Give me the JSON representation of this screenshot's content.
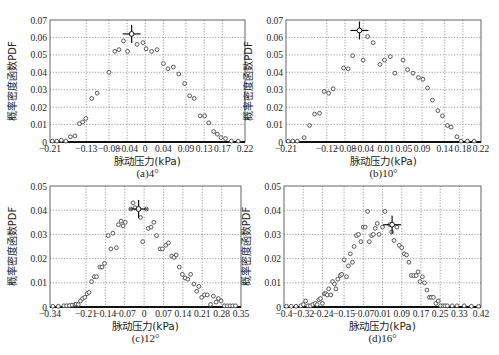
{
  "chart_data": [
    {
      "id": "a",
      "type": "scatter",
      "caption": "(a)4°",
      "xlabel": "脉动压力(kPa)",
      "ylabel": "概率密度函数PDF",
      "frame": [
        50,
        20,
        245,
        142
      ],
      "xlim": [
        -0.21,
        0.22
      ],
      "ylim": [
        0,
        0.07
      ],
      "xticks": [
        -0.21,
        -0.13,
        -0.08,
        -0.04,
        0,
        0.04,
        0.09,
        0.13,
        0.17,
        0.22
      ],
      "xtick_labels": [
        "−0.21",
        "−0.13",
        "−0.08",
        "−0.04",
        "0",
        "0.04",
        "0.09",
        "0.13",
        "0.17",
        "0.22"
      ],
      "yticks": [
        0,
        0.01,
        0.02,
        0.03,
        0.04,
        0.05,
        0.06,
        0.07
      ],
      "ytick_labels": [
        "0",
        "0.01",
        "0.02",
        "0.03",
        "0.04",
        "0.05",
        "0.06",
        "0.07"
      ],
      "grid": true,
      "marker_point": [
        -0.03,
        0.062
      ],
      "points": [
        [
          -0.205,
          0.0005
        ],
        [
          -0.195,
          0.0005
        ],
        [
          -0.185,
          0.001
        ],
        [
          -0.175,
          0.0005
        ],
        [
          -0.165,
          0.003
        ],
        [
          -0.155,
          0.0035
        ],
        [
          -0.145,
          0.0105
        ],
        [
          -0.138,
          0.0115
        ],
        [
          -0.131,
          0.0135
        ],
        [
          -0.118,
          0.025
        ],
        [
          -0.106,
          0.028
        ],
        [
          -0.08,
          0.04
        ],
        [
          -0.067,
          0.052
        ],
        [
          -0.058,
          0.053
        ],
        [
          -0.048,
          0.058
        ],
        [
          -0.039,
          0.052
        ],
        [
          -0.03,
          0.062
        ],
        [
          -0.018,
          0.056
        ],
        [
          -0.005,
          0.057
        ],
        [
          0.002,
          0.0535
        ],
        [
          0.014,
          0.052
        ],
        [
          0.026,
          0.053
        ],
        [
          0.04,
          0.045
        ],
        [
          0.05,
          0.042
        ],
        [
          0.062,
          0.043
        ],
        [
          0.074,
          0.039
        ],
        [
          0.087,
          0.0335
        ],
        [
          0.098,
          0.0265
        ],
        [
          0.108,
          0.025
        ],
        [
          0.121,
          0.015
        ],
        [
          0.131,
          0.015
        ],
        [
          0.14,
          0.011
        ],
        [
          0.151,
          0.006
        ],
        [
          0.159,
          0.0045
        ],
        [
          0.167,
          0.0025
        ],
        [
          0.177,
          0.002
        ],
        [
          0.19,
          0.0005
        ],
        [
          0.205,
          0.0005
        ]
      ]
    },
    {
      "id": "b",
      "type": "scatter",
      "caption": "(b)10°",
      "xlabel": "脉动压力(kPa)",
      "ylabel": "概率密度函数PDF",
      "frame": [
        286,
        20,
        481,
        142
      ],
      "xlim": [
        -0.21,
        0.22
      ],
      "ylim": [
        0,
        0.07
      ],
      "xticks": [
        -0.21,
        -0.12,
        -0.08,
        -0.04,
        0.01,
        0.05,
        0.09,
        0.14,
        0.18,
        0.22
      ],
      "xtick_labels": [
        "−0.21",
        "−0.12",
        "−0.08",
        "−0.04",
        "0.01",
        "0.05",
        "0.09",
        "0.14",
        "0.18",
        "0.22"
      ],
      "yticks": [
        0,
        0.01,
        0.02,
        0.03,
        0.04,
        0.05,
        0.06,
        0.07
      ],
      "ytick_labels": [
        "0",
        "0.01",
        "0.02",
        "0.03",
        "0.04",
        "0.05",
        "0.06",
        "0.07"
      ],
      "grid": true,
      "marker_point": [
        -0.048,
        0.064
      ],
      "points": [
        [
          -0.205,
          0.0005
        ],
        [
          -0.195,
          0.0005
        ],
        [
          -0.185,
          0.0005
        ],
        [
          -0.17,
          0.0025
        ],
        [
          -0.158,
          0.0095
        ],
        [
          -0.147,
          0.016
        ],
        [
          -0.136,
          0.0165
        ],
        [
          -0.126,
          0.029
        ],
        [
          -0.116,
          0.028
        ],
        [
          -0.106,
          0.0305
        ],
        [
          -0.083,
          0.0425
        ],
        [
          -0.073,
          0.042
        ],
        [
          -0.063,
          0.0495
        ],
        [
          -0.04,
          0.047
        ],
        [
          -0.03,
          0.0605
        ],
        [
          -0.018,
          0.057
        ],
        [
          -0.003,
          0.0445
        ],
        [
          0.007,
          0.047
        ],
        [
          0.02,
          0.049
        ],
        [
          0.03,
          0.0395
        ],
        [
          0.048,
          0.047
        ],
        [
          0.058,
          0.0415
        ],
        [
          0.07,
          0.0395
        ],
        [
          0.082,
          0.037
        ],
        [
          0.092,
          0.036
        ],
        [
          0.102,
          0.031
        ],
        [
          0.113,
          0.024
        ],
        [
          0.125,
          0.018
        ],
        [
          0.135,
          0.015
        ],
        [
          0.146,
          0.0095
        ],
        [
          0.154,
          0.0085
        ],
        [
          0.167,
          0.003
        ],
        [
          0.176,
          0.0005
        ],
        [
          0.19,
          0.0005
        ],
        [
          0.205,
          0.0005
        ]
      ]
    },
    {
      "id": "c",
      "type": "scatter",
      "caption": "(c)12°",
      "xlabel": "脉动压力(kPa)",
      "ylabel": "概率密度函数PDF",
      "frame": [
        50,
        186,
        241,
        307
      ],
      "xlim": [
        -0.34,
        0.35
      ],
      "ylim": [
        0,
        0.05
      ],
      "xticks": [
        -0.34,
        -0.21,
        -0.14,
        -0.07,
        0,
        0.07,
        0.14,
        0.21,
        0.28,
        0.35
      ],
      "xtick_labels": [
        "−0.34",
        "−0.21",
        "−0.14",
        "−0.07",
        "0",
        "0.07",
        "0.14",
        "0.21",
        "0.28",
        "0.35"
      ],
      "yticks": [
        0,
        0.01,
        0.02,
        0.03,
        0.04,
        0.05
      ],
      "ytick_labels": [
        "0",
        "0.01",
        "0.02",
        "0.03",
        "0.04",
        "0.05"
      ],
      "grid": true,
      "marker_point": [
        -0.02,
        0.0405
      ],
      "points": [
        [
          -0.33,
          0.0003
        ],
        [
          -0.31,
          0.0003
        ],
        [
          -0.29,
          0.0005
        ],
        [
          -0.28,
          0.0005
        ],
        [
          -0.27,
          0.0006
        ],
        [
          -0.26,
          0.0008
        ],
        [
          -0.25,
          0.001
        ],
        [
          -0.245,
          0.0012
        ],
        [
          -0.238,
          0.001
        ],
        [
          -0.23,
          0.0025
        ],
        [
          -0.222,
          0.0035
        ],
        [
          -0.214,
          0.004
        ],
        [
          -0.206,
          0.0055
        ],
        [
          -0.199,
          0.006
        ],
        [
          -0.19,
          0.0105
        ],
        [
          -0.18,
          0.0125
        ],
        [
          -0.172,
          0.0125
        ],
        [
          -0.16,
          0.0165
        ],
        [
          -0.152,
          0.0165
        ],
        [
          -0.143,
          0.018
        ],
        [
          -0.13,
          0.0295
        ],
        [
          -0.12,
          0.024
        ],
        [
          -0.113,
          0.0305
        ],
        [
          -0.1,
          0.0245
        ],
        [
          -0.093,
          0.034
        ],
        [
          -0.083,
          0.0355
        ],
        [
          -0.076,
          0.0335
        ],
        [
          -0.068,
          0.035
        ],
        [
          -0.048,
          0.0405
        ],
        [
          -0.04,
          0.043
        ],
        [
          -0.033,
          0.041
        ],
        [
          -0.02,
          0.0405
        ],
        [
          -0.013,
          0.037
        ],
        [
          -0.005,
          0.027
        ],
        [
          0.008,
          0.0405
        ],
        [
          0.015,
          0.0325
        ],
        [
          0.025,
          0.033
        ],
        [
          0.035,
          0.035
        ],
        [
          0.045,
          0.0295
        ],
        [
          0.058,
          0.024
        ],
        [
          0.066,
          0.024
        ],
        [
          0.078,
          0.0255
        ],
        [
          0.088,
          0.0265
        ],
        [
          0.1,
          0.021
        ],
        [
          0.108,
          0.0205
        ],
        [
          0.116,
          0.0215
        ],
        [
          0.127,
          0.0165
        ],
        [
          0.138,
          0.0135
        ],
        [
          0.148,
          0.012
        ],
        [
          0.158,
          0.0115
        ],
        [
          0.168,
          0.0135
        ],
        [
          0.18,
          0.0095
        ],
        [
          0.19,
          0.0065
        ],
        [
          0.198,
          0.0085
        ],
        [
          0.208,
          0.004
        ],
        [
          0.218,
          0.005
        ],
        [
          0.228,
          0.005
        ],
        [
          0.24,
          0.001
        ],
        [
          0.25,
          0.0045
        ],
        [
          0.26,
          0.002
        ],
        [
          0.268,
          0.0035
        ],
        [
          0.278,
          0.0025
        ],
        [
          0.29,
          0.0005
        ],
        [
          0.3,
          0.0005
        ],
        [
          0.31,
          0.0005
        ],
        [
          0.32,
          0.0005
        ],
        [
          0.33,
          0.0005
        ]
      ]
    },
    {
      "id": "d",
      "type": "scatter",
      "caption": "(d)16°",
      "xlabel": "脉动压力(kPa)",
      "ylabel": "概率密度函数PDF",
      "frame": [
        284,
        186,
        481,
        307
      ],
      "xlim": [
        -0.4,
        0.42
      ],
      "ylim": [
        0,
        0.05
      ],
      "xticks": [
        -0.4,
        -0.32,
        -0.24,
        -0.15,
        -0.07,
        0.01,
        0.09,
        0.17,
        0.25,
        0.33,
        0.42
      ],
      "xtick_labels": [
        "−0.4",
        "−0.32",
        "−0.24",
        "−0.15",
        "−0.07",
        "0.01",
        "0.09",
        "0.17",
        "0.25",
        "0.33",
        "0.42"
      ],
      "yticks": [
        0,
        0.01,
        0.02,
        0.03,
        0.04,
        0.05
      ],
      "ytick_labels": [
        "0",
        "0.01",
        "0.02",
        "0.03",
        "0.04",
        "0.05"
      ],
      "grid": true,
      "marker_point": [
        0.05,
        0.034
      ],
      "points": [
        [
          -0.39,
          0.0003
        ],
        [
          -0.37,
          0.0003
        ],
        [
          -0.35,
          0.0003
        ],
        [
          -0.33,
          0.0005
        ],
        [
          -0.32,
          0.001
        ],
        [
          -0.31,
          0.0025
        ],
        [
          -0.3,
          0.0005
        ],
        [
          -0.29,
          0.0005
        ],
        [
          -0.28,
          0.001
        ],
        [
          -0.27,
          0.0015
        ],
        [
          -0.262,
          0.001
        ],
        [
          -0.255,
          0.003
        ],
        [
          -0.248,
          0.0035
        ],
        [
          -0.24,
          0.0015
        ],
        [
          -0.232,
          0.0055
        ],
        [
          -0.226,
          0.0055
        ],
        [
          -0.22,
          0.005
        ],
        [
          -0.214,
          0.0075
        ],
        [
          -0.205,
          0.005
        ],
        [
          -0.198,
          0.0105
        ],
        [
          -0.19,
          0.0095
        ],
        [
          -0.184,
          0.0075
        ],
        [
          -0.176,
          0.0115
        ],
        [
          -0.166,
          0.013
        ],
        [
          -0.16,
          0.0135
        ],
        [
          -0.15,
          0.0195
        ],
        [
          -0.14,
          0.0125
        ],
        [
          -0.132,
          0.017
        ],
        [
          -0.124,
          0.022
        ],
        [
          -0.115,
          0.0185
        ],
        [
          -0.108,
          0.025
        ],
        [
          -0.098,
          0.0295
        ],
        [
          -0.09,
          0.03
        ],
        [
          -0.08,
          0.027
        ],
        [
          -0.07,
          0.033
        ],
        [
          -0.062,
          0.033
        ],
        [
          -0.052,
          0.0395
        ],
        [
          -0.045,
          0.027
        ],
        [
          -0.035,
          0.0295
        ],
        [
          -0.028,
          0.03
        ],
        [
          -0.02,
          0.0325
        ],
        [
          -0.012,
          0.0345
        ],
        [
          -0.004,
          0.03
        ],
        [
          0.01,
          0.033
        ],
        [
          0.02,
          0.0395
        ],
        [
          0.04,
          0.034
        ],
        [
          0.048,
          0.031
        ],
        [
          0.058,
          0.0275
        ],
        [
          0.07,
          0.033
        ],
        [
          0.08,
          0.0255
        ],
        [
          0.09,
          0.0245
        ],
        [
          0.1,
          0.022
        ],
        [
          0.11,
          0.0215
        ],
        [
          0.12,
          0.0185
        ],
        [
          0.13,
          0.013
        ],
        [
          0.14,
          0.013
        ],
        [
          0.15,
          0.013
        ],
        [
          0.158,
          0.0145
        ],
        [
          0.166,
          0.0105
        ],
        [
          0.176,
          0.0125
        ],
        [
          0.185,
          0.01
        ],
        [
          0.195,
          0.007
        ],
        [
          0.205,
          0.004
        ],
        [
          0.213,
          0.004
        ],
        [
          0.222,
          0.004
        ],
        [
          0.232,
          0.0015
        ],
        [
          0.242,
          0.0025
        ],
        [
          0.252,
          0.0005
        ],
        [
          0.262,
          0.0005
        ],
        [
          0.27,
          0.0005
        ],
        [
          0.28,
          0.0005
        ],
        [
          0.3,
          0.0005
        ],
        [
          0.32,
          0.0005
        ],
        [
          0.35,
          0.0005
        ],
        [
          0.38,
          0.0003
        ],
        [
          0.41,
          0.0003
        ]
      ]
    }
  ]
}
